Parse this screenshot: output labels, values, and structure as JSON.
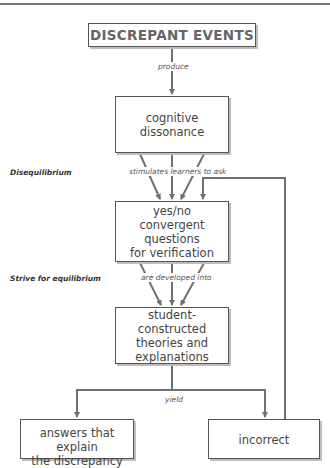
{
  "diagram": {
    "nodes": {
      "discrepant_events": "DISCREPANT EVENTS",
      "cognitive_dissonance": "cognitive\ndissonance",
      "convergent_questions": "yes/no\nconvergent questions\nfor verification",
      "student_theories": "student-constructed\ntheories and\nexplanations",
      "answers": "answers that explain\nthe discrepancy",
      "incorrect": "incorrect"
    },
    "edge_labels": {
      "produce": "produce",
      "stimulates": "stimulates learners to ask",
      "developed": "are developed into",
      "yield": "yield"
    },
    "stage_labels": {
      "disequilibrium": "Disequilibrium",
      "equilibrium": "Strive for equilibrium"
    },
    "colors": {
      "line": "#707070",
      "border": "#555555"
    }
  }
}
